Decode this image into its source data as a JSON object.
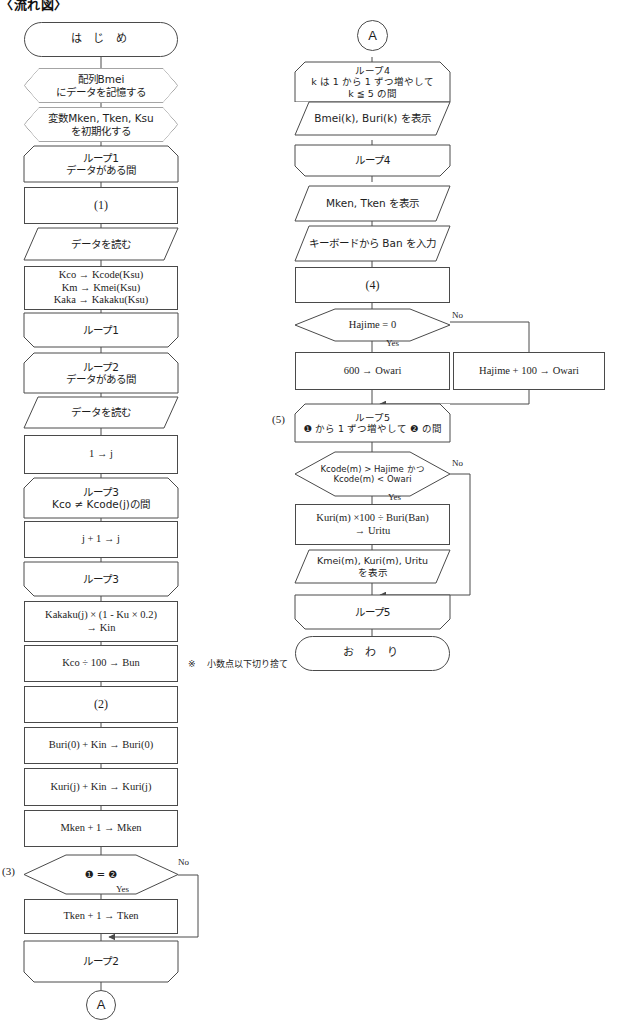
{
  "document": {
    "title": "〈流れ図〉",
    "note_marker": "※",
    "note_text": "小数点以下切り捨て"
  },
  "labels": {
    "yes": "Yes",
    "no": "No",
    "blank1": "(1)",
    "blank2": "(2)",
    "blank3": "(3)",
    "blank4": "(4)",
    "blank5": "(5)",
    "connector_a": "A"
  },
  "left_column": [
    {
      "id": "start",
      "type": "terminator",
      "text": "は  じ  め"
    },
    {
      "id": "prep-bmei",
      "type": "preparation",
      "text": "配列Bmei\nにデータを記憶する"
    },
    {
      "id": "prep-vars",
      "type": "preparation",
      "text": "変数Mken, Tken, Ksu\nを初期化する"
    },
    {
      "id": "loop1-start",
      "type": "loop-start",
      "text": "ループ1\nデータがある間"
    },
    {
      "id": "blank1-box",
      "type": "process",
      "text": "(1)"
    },
    {
      "id": "read-data-1",
      "type": "io",
      "text": "データを読む"
    },
    {
      "id": "assign-kco",
      "type": "process",
      "text": "Kco → Kcode(Ksu)\nKm → Kmei(Ksu)\nKaka → Kakaku(Ksu)"
    },
    {
      "id": "loop1-end",
      "type": "loop-end",
      "text": "ループ1"
    },
    {
      "id": "loop2-start",
      "type": "loop-start",
      "text": "ループ2\nデータがある間"
    },
    {
      "id": "read-data-2",
      "type": "io",
      "text": "データを読む"
    },
    {
      "id": "init-j",
      "type": "process",
      "text": "1 → j"
    },
    {
      "id": "loop3-start",
      "type": "loop-start",
      "text": "ループ3\nKco ≠ Kcode(j)の間"
    },
    {
      "id": "incr-j",
      "type": "process",
      "text": "j + 1 → j"
    },
    {
      "id": "loop3-end",
      "type": "loop-end",
      "text": "ループ3"
    },
    {
      "id": "calc-kin",
      "type": "process",
      "text": "Kakaku(j) × (1 - Ku × 0.2)\n→ Kin"
    },
    {
      "id": "calc-bun",
      "type": "process",
      "text": "Kco ÷ 100 → Bun"
    },
    {
      "id": "blank2-box",
      "type": "process",
      "text": "(2)"
    },
    {
      "id": "buri-acc",
      "type": "process",
      "text": "Buri(0) + Kin → Buri(0)"
    },
    {
      "id": "kuri-acc",
      "type": "process",
      "text": "Kuri(j) + Kin → Kuri(j)"
    },
    {
      "id": "mken-incr",
      "type": "process",
      "text": "Mken + 1 → Mken"
    },
    {
      "id": "dec-eq",
      "type": "decision",
      "text": "❶ = ❷"
    },
    {
      "id": "tken-incr",
      "type": "process",
      "text": "Tken + 1 → Tken"
    },
    {
      "id": "loop2-end",
      "type": "loop-end",
      "text": "ループ2"
    },
    {
      "id": "conn-a-out",
      "type": "connector",
      "text": "A"
    }
  ],
  "right_column": [
    {
      "id": "conn-a-in",
      "type": "connector",
      "text": "A"
    },
    {
      "id": "loop4-start",
      "type": "loop-start",
      "text": "ループ4\nk は 1 から 1 ずつ増やして\nk ≦ 5 の間"
    },
    {
      "id": "print-bmei",
      "type": "io",
      "text": "Bmei(k), Buri(k) を表示"
    },
    {
      "id": "loop4-end",
      "type": "loop-end",
      "text": "ループ4"
    },
    {
      "id": "print-mken",
      "type": "io",
      "text": "Mken, Tken を表示"
    },
    {
      "id": "input-ban",
      "type": "io",
      "text": "キーボードから Ban を入力"
    },
    {
      "id": "blank4-box",
      "type": "process",
      "text": "(4)"
    },
    {
      "id": "dec-hajime",
      "type": "decision",
      "text": "Hajime =  0"
    },
    {
      "id": "owari-600",
      "type": "process",
      "text": "600 → Owari"
    },
    {
      "id": "owari-calc",
      "type": "process",
      "text": "Hajime + 100 → Owari"
    },
    {
      "id": "loop5-start",
      "type": "loop-start",
      "text": "ループ5\n❶ から 1 ずつ増やして ❷ の間"
    },
    {
      "id": "dec-kcode",
      "type": "decision",
      "text": "Kcode(m) >  Hajime かつ\nKcode(m) < Owari"
    },
    {
      "id": "calc-uritu",
      "type": "process",
      "text": "Kuri(m) ×100 ÷ Buri(Ban)\n→ Uritu"
    },
    {
      "id": "print-kmei",
      "type": "io",
      "text": "Kmei(m), Kuri(m), Uritu\nを表示"
    },
    {
      "id": "loop5-end",
      "type": "loop-end",
      "text": "ループ5"
    },
    {
      "id": "end",
      "type": "terminator",
      "text": "お  わ  り"
    }
  ]
}
